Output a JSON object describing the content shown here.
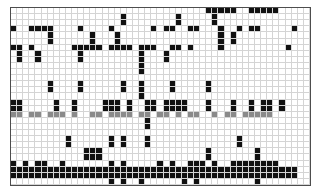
{
  "figure": {
    "name": "binary-matrix-heatmap",
    "background": "#ffffff",
    "frame_color": "#4d4d4d",
    "gridline_color": "#d4d4d4"
  },
  "chart_data": {
    "type": "heatmap",
    "title": "",
    "subtitle": "",
    "xlabel": "",
    "ylabel": "",
    "xticklabels": [],
    "yticklabels": [],
    "grid": true,
    "legend": null,
    "n_cols": 49,
    "n_rows": 29,
    "value_levels": [
      0,
      1,
      2
    ],
    "colors": {
      "0": "#ffffff",
      "1": "#111111",
      "2": "#8a8a8a"
    },
    "value_labels": {
      "0": "absent",
      "1": "present",
      "2": "highlighted-row"
    },
    "matrix": [
      [
        0,
        0,
        0,
        0,
        0,
        0,
        0,
        0,
        0,
        0,
        0,
        0,
        0,
        0,
        0,
        0,
        0,
        0,
        0,
        0,
        0,
        0,
        0,
        0,
        0,
        0,
        0,
        0,
        0,
        0,
        0,
        0,
        1,
        1,
        1,
        1,
        1,
        0,
        0,
        1,
        1,
        1,
        1,
        1,
        0,
        0,
        0,
        0,
        0
      ],
      [
        0,
        0,
        0,
        0,
        0,
        0,
        0,
        0,
        0,
        0,
        0,
        0,
        0,
        0,
        0,
        0,
        0,
        0,
        1,
        0,
        0,
        0,
        0,
        0,
        0,
        0,
        0,
        1,
        0,
        0,
        0,
        0,
        0,
        1,
        0,
        0,
        0,
        0,
        0,
        0,
        0,
        0,
        0,
        0,
        0,
        0,
        0,
        0,
        0
      ],
      [
        1,
        0,
        0,
        1,
        1,
        1,
        1,
        0,
        0,
        0,
        0,
        1,
        0,
        0,
        0,
        0,
        1,
        0,
        0,
        0,
        0,
        0,
        0,
        1,
        0,
        1,
        1,
        0,
        0,
        1,
        1,
        0,
        0,
        0,
        1,
        0,
        0,
        1,
        0,
        1,
        1,
        0,
        0,
        0,
        0,
        0,
        1,
        0,
        0
      ],
      [
        0,
        0,
        0,
        0,
        0,
        0,
        1,
        0,
        0,
        0,
        0,
        0,
        0,
        1,
        0,
        0,
        0,
        1,
        0,
        0,
        0,
        0,
        0,
        0,
        0,
        0,
        0,
        0,
        0,
        0,
        0,
        0,
        0,
        0,
        1,
        0,
        1,
        0,
        0,
        0,
        0,
        0,
        0,
        0,
        0,
        0,
        0,
        0,
        0
      ],
      [
        1,
        1,
        0,
        1,
        0,
        0,
        0,
        0,
        0,
        0,
        1,
        1,
        1,
        1,
        1,
        0,
        1,
        1,
        1,
        1,
        0,
        1,
        1,
        1,
        0,
        0,
        1,
        1,
        0,
        1,
        0,
        0,
        0,
        0,
        1,
        0,
        0,
        0,
        0,
        0,
        0,
        0,
        0,
        0,
        0,
        1,
        0,
        0,
        0
      ],
      [
        0,
        1,
        0,
        0,
        1,
        0,
        0,
        0,
        0,
        0,
        0,
        1,
        0,
        0,
        0,
        0,
        0,
        0,
        0,
        0,
        0,
        1,
        0,
        0,
        0,
        1,
        0,
        0,
        0,
        0,
        0,
        0,
        0,
        0,
        0,
        0,
        0,
        0,
        0,
        0,
        0,
        0,
        0,
        0,
        0,
        0,
        0,
        0,
        0
      ],
      [
        0,
        0,
        0,
        0,
        0,
        0,
        0,
        0,
        0,
        0,
        0,
        0,
        0,
        0,
        0,
        0,
        0,
        0,
        0,
        0,
        0,
        1,
        0,
        0,
        0,
        0,
        0,
        0,
        0,
        0,
        0,
        0,
        0,
        0,
        0,
        0,
        0,
        0,
        0,
        0,
        0,
        0,
        0,
        0,
        0,
        0,
        0,
        0,
        0
      ],
      [
        0,
        0,
        0,
        0,
        0,
        0,
        0,
        0,
        0,
        0,
        0,
        0,
        0,
        0,
        0,
        0,
        0,
        0,
        0,
        0,
        0,
        0,
        0,
        0,
        0,
        0,
        0,
        0,
        0,
        0,
        0,
        0,
        0,
        0,
        0,
        0,
        0,
        0,
        0,
        0,
        0,
        0,
        0,
        0,
        0,
        0,
        0,
        0,
        0
      ],
      [
        0,
        0,
        0,
        0,
        0,
        0,
        1,
        0,
        0,
        0,
        0,
        1,
        0,
        0,
        0,
        0,
        0,
        0,
        1,
        0,
        0,
        1,
        0,
        0,
        0,
        0,
        1,
        0,
        0,
        0,
        0,
        0,
        1,
        0,
        0,
        0,
        0,
        0,
        0,
        0,
        0,
        0,
        0,
        0,
        0,
        0,
        0,
        0,
        0
      ],
      [
        0,
        0,
        0,
        0,
        0,
        0,
        0,
        0,
        0,
        0,
        0,
        0,
        0,
        0,
        0,
        0,
        0,
        0,
        0,
        0,
        0,
        1,
        0,
        0,
        0,
        0,
        0,
        0,
        0,
        0,
        0,
        0,
        0,
        0,
        0,
        0,
        0,
        0,
        0,
        0,
        0,
        0,
        0,
        0,
        0,
        0,
        0,
        0,
        0
      ],
      [
        1,
        1,
        0,
        0,
        0,
        0,
        0,
        1,
        0,
        0,
        1,
        0,
        0,
        0,
        0,
        1,
        1,
        1,
        0,
        1,
        0,
        0,
        1,
        1,
        0,
        1,
        1,
        1,
        1,
        0,
        0,
        0,
        1,
        0,
        0,
        0,
        1,
        0,
        0,
        1,
        0,
        1,
        1,
        0,
        1,
        0,
        0,
        0,
        0
      ],
      [
        2,
        2,
        0,
        2,
        2,
        0,
        2,
        2,
        2,
        0,
        2,
        0,
        0,
        2,
        2,
        0,
        2,
        2,
        2,
        2,
        0,
        2,
        2,
        0,
        2,
        2,
        0,
        2,
        0,
        2,
        2,
        0,
        0,
        2,
        0,
        2,
        2,
        0,
        2,
        2,
        2,
        2,
        2,
        0,
        0,
        0,
        0,
        0,
        0
      ],
      [
        0,
        0,
        0,
        0,
        0,
        0,
        0,
        0,
        0,
        0,
        0,
        0,
        0,
        0,
        0,
        0,
        0,
        0,
        0,
        0,
        0,
        0,
        1,
        0,
        0,
        0,
        0,
        0,
        0,
        0,
        0,
        0,
        0,
        0,
        0,
        0,
        0,
        0,
        0,
        0,
        0,
        0,
        0,
        0,
        0,
        0,
        0,
        0,
        0
      ],
      [
        0,
        0,
        0,
        0,
        0,
        0,
        0,
        0,
        0,
        0,
        0,
        0,
        0,
        0,
        0,
        0,
        0,
        0,
        0,
        0,
        0,
        0,
        0,
        0,
        0,
        0,
        0,
        0,
        0,
        0,
        0,
        0,
        0,
        0,
        0,
        0,
        0,
        0,
        0,
        0,
        0,
        0,
        0,
        0,
        0,
        0,
        0,
        0,
        0
      ],
      [
        0,
        0,
        0,
        0,
        0,
        0,
        0,
        0,
        0,
        1,
        0,
        0,
        0,
        0,
        0,
        0,
        1,
        0,
        1,
        0,
        0,
        0,
        1,
        0,
        0,
        0,
        0,
        0,
        0,
        0,
        0,
        0,
        0,
        0,
        0,
        0,
        0,
        1,
        0,
        0,
        0,
        0,
        0,
        0,
        0,
        0,
        0,
        0,
        0
      ],
      [
        0,
        0,
        0,
        0,
        0,
        0,
        0,
        0,
        0,
        0,
        0,
        0,
        1,
        1,
        1,
        0,
        0,
        0,
        0,
        0,
        0,
        0,
        0,
        0,
        0,
        0,
        0,
        0,
        0,
        0,
        0,
        0,
        1,
        0,
        0,
        0,
        0,
        0,
        0,
        0,
        1,
        0,
        0,
        0,
        0,
        0,
        0,
        0,
        0
      ],
      [
        1,
        0,
        1,
        0,
        1,
        1,
        0,
        0,
        1,
        0,
        0,
        0,
        0,
        0,
        0,
        0,
        1,
        0,
        1,
        0,
        0,
        0,
        0,
        0,
        1,
        0,
        1,
        0,
        0,
        1,
        1,
        1,
        0,
        1,
        0,
        0,
        1,
        1,
        1,
        1,
        1,
        1,
        1,
        1,
        0,
        0,
        0,
        0,
        0
      ],
      [
        1,
        1,
        1,
        1,
        1,
        1,
        1,
        1,
        1,
        1,
        1,
        1,
        1,
        1,
        1,
        1,
        1,
        1,
        1,
        1,
        1,
        1,
        1,
        1,
        1,
        1,
        1,
        1,
        1,
        1,
        1,
        1,
        1,
        1,
        1,
        1,
        1,
        1,
        1,
        1,
        1,
        1,
        1,
        1,
        1,
        1,
        1,
        0,
        0
      ],
      [
        0,
        0,
        0,
        0,
        0,
        0,
        0,
        0,
        0,
        0,
        0,
        0,
        0,
        0,
        0,
        0,
        1,
        0,
        1,
        0,
        0,
        1,
        0,
        0,
        0,
        0,
        0,
        0,
        1,
        0,
        1,
        0,
        0,
        0,
        0,
        0,
        0,
        0,
        0,
        0,
        1,
        0,
        0,
        0,
        0,
        0,
        0,
        0,
        0
      ]
    ]
  }
}
